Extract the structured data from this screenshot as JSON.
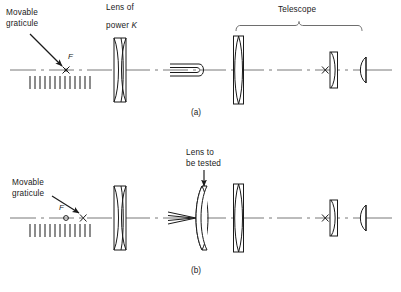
{
  "figure": {
    "background": "#ffffff",
    "ink": "#1a1a1a",
    "width": 401,
    "height": 292
  },
  "panel_a": {
    "id": "(a)",
    "labels": {
      "graticule_line1": "Movable",
      "graticule_line2": "graticule",
      "lens_line1": "Lens of",
      "lens_line2_prefix": "power ",
      "lens_power_symbol": "K",
      "telescope": "Telescope"
    },
    "markers": {
      "focus_symbol": "F",
      "cross_symbol": "×",
      "telescope_cross_symbol": "×"
    },
    "graticule_tick_count": 13,
    "components": [
      {
        "name": "movable-graticule",
        "kind": "graticule"
      },
      {
        "name": "collimating-doublet",
        "kind": "cemented-doublet",
        "label": "Lens of power K"
      },
      {
        "name": "parallel-beam-indicator",
        "kind": "beam-marker"
      },
      {
        "name": "telescope-objective",
        "kind": "biconvex-mounted"
      },
      {
        "name": "telescope-field-lens",
        "kind": "plano-convex"
      },
      {
        "name": "telescope-eye-lens",
        "kind": "plano-convex"
      }
    ]
  },
  "panel_b": {
    "id": "(b)",
    "labels": {
      "graticule_line1": "Movable",
      "graticule_line2": "graticule",
      "test_lens_line1": "Lens to",
      "test_lens_line2": "be tested"
    },
    "markers": {
      "focus_symbol": "F",
      "cross_symbol": "×",
      "telescope_cross_symbol": "×"
    },
    "graticule_tick_count": 13,
    "components": [
      {
        "name": "movable-graticule",
        "kind": "graticule"
      },
      {
        "name": "collimating-doublet",
        "kind": "cemented-doublet"
      },
      {
        "name": "converging-beam-indicator",
        "kind": "beam-marker"
      },
      {
        "name": "lens-under-test",
        "kind": "negative-meniscus",
        "label": "Lens to be tested"
      },
      {
        "name": "telescope-objective",
        "kind": "biconvex-mounted"
      },
      {
        "name": "telescope-field-lens",
        "kind": "plano-convex"
      },
      {
        "name": "telescope-eye-lens",
        "kind": "plano-convex"
      }
    ]
  }
}
